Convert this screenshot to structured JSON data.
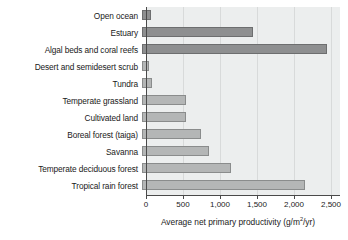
{
  "chart_data": {
    "type": "bar",
    "orientation": "horizontal",
    "title": "",
    "xlabel": "Average net primary productivity (g/m2/yr)",
    "xlabel_parts": {
      "prefix": "Average net primary productivity (g/m",
      "superscript": "2",
      "suffix": "/yr)"
    },
    "ylabel": "",
    "categories": [
      "Open ocean",
      "Estuary",
      "Algal beds and coral reefs",
      "Desert and semidesert scrub",
      "Tundra",
      "Temperate grassland",
      "Cultivated land",
      "Boreal forest (taiga)",
      "Savanna",
      "Temperate deciduous forest",
      "Tropical rain forest"
    ],
    "values": [
      125,
      1500,
      2500,
      90,
      140,
      600,
      600,
      800,
      900,
      1200,
      2200
    ],
    "bar_styles": [
      "dark",
      "dark",
      "dark",
      "light",
      "light",
      "light",
      "light",
      "light",
      "light",
      "light",
      "light"
    ],
    "xlim": [
      0,
      2620
    ],
    "xticks": [
      0,
      500,
      1000,
      1500,
      2000,
      2500
    ],
    "xtick_labels": [
      "0",
      "500",
      "1,000",
      "1,500",
      "2,000",
      "2,500"
    ],
    "grid": true,
    "grid_axis": "x",
    "legend": null,
    "colors": {
      "bar_dark": "#8e8f90",
      "bar_light": "#b4b6b6",
      "bar_border": "#7b7d7d",
      "panel_background": "#eceeee",
      "gridline": "#d8dada",
      "axis": "#4a4a4a",
      "text": "#1a1a1a",
      "page_background": "#ffffff"
    }
  }
}
